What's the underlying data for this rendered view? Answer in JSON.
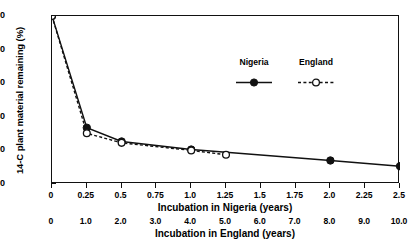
{
  "chart_data": {
    "type": "line",
    "title": "",
    "xlabel": "Incubation in Nigeria (years)",
    "xlabel2": "Incubation in England (years)",
    "ylabel": "14-C plant material remaining (%)",
    "xlim": [
      0,
      2.5
    ],
    "ylim": [
      0,
      100
    ],
    "grid": false,
    "legend_position": "upper-right-inside",
    "xticks": [
      "0",
      "0.25",
      "0.5",
      "0.75",
      "1.0",
      "1.25",
      "1.5",
      "1.75",
      "2.0",
      "2.25",
      "2.5"
    ],
    "xtick_values": [
      0,
      0.25,
      0.5,
      0.75,
      1.0,
      1.25,
      1.5,
      1.75,
      2.0,
      2.25,
      2.5
    ],
    "xticks2": [
      "0",
      "1.0",
      "2.0",
      "3.0",
      "4.0",
      "5.0",
      "6.0",
      "7.0",
      "8.0",
      "9.0",
      "10.0"
    ],
    "xtick2_values": [
      0,
      1,
      2,
      3,
      4,
      5,
      6,
      7,
      8,
      9,
      10
    ],
    "yticks": [
      "0",
      "20",
      "40",
      "60",
      "80",
      "100"
    ],
    "ytick_values": [
      0,
      20,
      40,
      60,
      80,
      100
    ],
    "series": [
      {
        "name": "Nigeria",
        "marker": "filled-circle",
        "linestyle": "solid",
        "color": "#111111",
        "x": [
          0,
          0.25,
          0.5,
          1.0,
          2.0,
          2.5
        ],
        "values": [
          100,
          33.5,
          25.3,
          20.5,
          14.0,
          10.6
        ]
      },
      {
        "name": "England",
        "marker": "open-circle",
        "linestyle": "dashed",
        "color": "#111111",
        "x": [
          0,
          0.25,
          0.5,
          1.0,
          1.25
        ],
        "values": [
          100,
          30.2,
          24.5,
          20.0,
          17.4
        ]
      }
    ]
  },
  "legend": {
    "items": [
      {
        "label": "Nigeria"
      },
      {
        "label": "England"
      }
    ]
  }
}
